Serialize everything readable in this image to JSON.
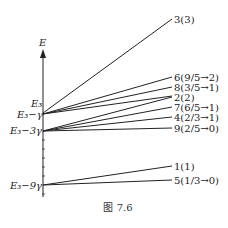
{
  "axis": {
    "label": "E",
    "color": "#222222"
  },
  "levels": [
    {
      "label": "E₃",
      "y": 110
    },
    {
      "label": "E₃−γ",
      "y": 114
    },
    {
      "label": "E₃−3γ",
      "y": 131
    },
    {
      "label": "E₃−9γ",
      "y": 185
    }
  ],
  "lines": [
    {
      "label": "3(3)",
      "from": 0,
      "y_end": 19
    },
    {
      "label": "6(9/5→2)",
      "from": 1,
      "y_end": 77
    },
    {
      "label": "8(3/5→1)",
      "from": 1,
      "y_end": 87
    },
    {
      "label": "2(2)",
      "from": 2,
      "y_end": 97
    },
    {
      "label": "7(6/5→1)",
      "from": 2,
      "y_end": 107
    },
    {
      "label": "4(2/3→1)",
      "from": 2,
      "y_end": 117
    },
    {
      "label": "9(2/5→0)",
      "from": 2,
      "y_end": 128
    },
    {
      "label": "1(1)",
      "from": 3,
      "y_end": 166
    },
    {
      "label": "5(1/3→0)",
      "from": 3,
      "y_end": 180
    }
  ],
  "caption": "图 7.6"
}
